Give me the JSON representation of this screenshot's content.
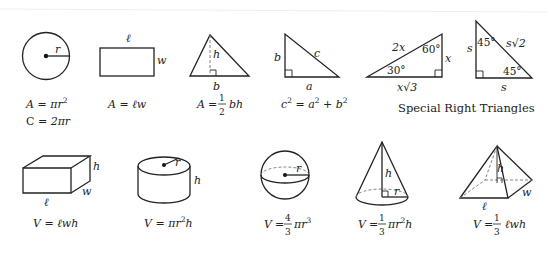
{
  "shapes": {
    "circle": {
      "labels": {
        "radius": "r"
      },
      "formulas": [
        "A = πr²",
        "C = 2πr"
      ]
    },
    "rectangle": {
      "labels": {
        "length": "ℓ",
        "width": "w"
      },
      "formulas": [
        "A = ℓw"
      ]
    },
    "triangle": {
      "labels": {
        "height": "h",
        "base": "b"
      },
      "formulas": [
        "A = ½bh"
      ]
    },
    "right_triangle": {
      "labels": {
        "leg_b": "b",
        "hyp": "c",
        "leg_a": "a"
      },
      "formulas": [
        "c² = a² + b²"
      ]
    },
    "triangle_30_60_90": {
      "labels": {
        "hyp": "2x",
        "angle_top": "60°",
        "angle_bottom": "30°",
        "short_leg": "x",
        "long_leg": "x√3"
      }
    },
    "triangle_45_45_90": {
      "labels": {
        "left": "s",
        "angle_top": "45°",
        "hyp": "s√2",
        "angle_bottom": "45°",
        "bottom": "s"
      }
    },
    "special_title": "Special Right Triangles",
    "box": {
      "labels": {
        "height": "h",
        "width": "w",
        "length": "ℓ"
      },
      "formulas": [
        "V = ℓwh"
      ]
    },
    "cylinder": {
      "labels": {
        "radius": "r",
        "height": "h"
      },
      "formulas": [
        "V = πr²h"
      ]
    },
    "sphere": {
      "labels": {
        "radius": "r"
      },
      "formulas": [
        "V = 4/3 πr³"
      ]
    },
    "cone": {
      "labels": {
        "height": "h",
        "radius": "r"
      },
      "formulas": [
        "V = 1/3 πr²h"
      ]
    },
    "pyramid": {
      "labels": {
        "height": "h",
        "length": "ℓ",
        "width": "w"
      },
      "formulas": [
        "V = 1/3 ℓwh"
      ]
    }
  },
  "text": {
    "eq": "=",
    "A": "A",
    "C": "C",
    "V": "V",
    "pi_r": "πr",
    "two_pi_r": "2πr",
    "lw": "ℓw",
    "bh": "bh",
    "one": "1",
    "two": "2",
    "three": "3",
    "four": "4",
    "sup2": "2",
    "sup3": "3",
    "c": "c",
    "a": "a",
    "b": "b",
    "plus": "+",
    "lwh": "ℓwh",
    "h": "h",
    "pi_r_plain": "πr"
  }
}
